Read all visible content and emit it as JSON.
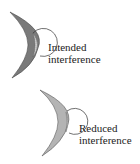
{
  "diagrams": [
    {
      "label_line1": "Intended",
      "label_line2": "interference",
      "crescent_color": "#7a7a7a",
      "crescent_edge": "#444444"
    },
    {
      "label_line1": "Reduced",
      "label_line2": "interference",
      "crescent_color": "#b4b4b4",
      "crescent_edge": "#555555"
    }
  ]
}
